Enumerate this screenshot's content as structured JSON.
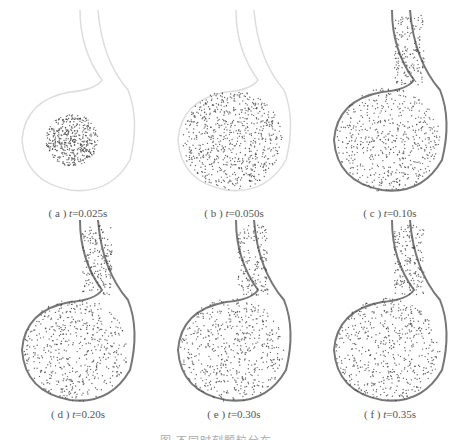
{
  "figure": {
    "panels": [
      {
        "label": "( a )",
        "var": "t",
        "value": "=0.025s",
        "stage": 0
      },
      {
        "label": "( b )",
        "var": "t",
        "value": "=0.050s",
        "stage": 1
      },
      {
        "label": "( c )",
        "var": "t",
        "value": "=0.10s",
        "stage": 2
      },
      {
        "label": "( d )",
        "var": "t",
        "value": "=0.20s",
        "stage": 3
      },
      {
        "label": "( e )",
        "var": "t",
        "value": "=0.30s",
        "stage": 4
      },
      {
        "label": "( f )",
        "var": "t",
        "value": "=0.35s",
        "stage": 5
      }
    ],
    "caption": "图  不同时刻颗粒分布"
  }
}
